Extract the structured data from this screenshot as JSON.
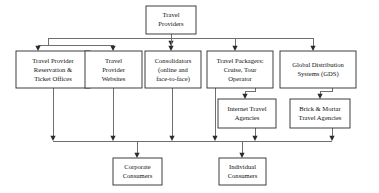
{
  "diagram": {
    "colors": {
      "background": "#ffffff",
      "box_border": "#2b2b2b",
      "connector": "#6f6f6f",
      "arrow": "#2b2b2b",
      "text": "#111111"
    },
    "nodes": [
      {
        "id": "travel-providers",
        "lines": [
          "Travel",
          "Providers"
        ],
        "x": 146,
        "y": 6,
        "w": 50,
        "h": 28
      },
      {
        "id": "provider-reservation-offices",
        "lines": [
          "Travel Provider",
          "Reservation &",
          "Ticket Offices"
        ],
        "x": 16,
        "y": 51,
        "w": 74,
        "h": 37
      },
      {
        "id": "provider-websites",
        "lines": [
          "Travel",
          "Provider",
          "Websites"
        ],
        "x": 85,
        "y": 51,
        "w": 57,
        "h": 37
      },
      {
        "id": "consolidators",
        "lines": [
          "Consolidators",
          "(online and",
          "face-to-face)"
        ],
        "x": 145,
        "y": 51,
        "w": 56,
        "h": 37
      },
      {
        "id": "travel-packagers",
        "lines": [
          "Travel Packagers:",
          "Cruise, Tour",
          "Operator"
        ],
        "x": 207,
        "y": 51,
        "w": 66,
        "h": 37
      },
      {
        "id": "global-distribution-systems",
        "lines": [
          "Global Distribution",
          "Systems (GDS)"
        ],
        "x": 280,
        "y": 51,
        "w": 76,
        "h": 37
      },
      {
        "id": "internet-travel-agencies",
        "lines": [
          "Internet Travel",
          "Agencies"
        ],
        "x": 218,
        "y": 99,
        "w": 58,
        "h": 29
      },
      {
        "id": "brick-mortar-travel-agencies",
        "lines": [
          "Brick & Mortar",
          "Travel Agencies"
        ],
        "x": 290,
        "y": 99,
        "w": 60,
        "h": 29
      },
      {
        "id": "corporate-consumers",
        "lines": [
          "Corporate",
          "Consumers"
        ],
        "x": 113,
        "y": 158,
        "w": 49,
        "h": 27
      },
      {
        "id": "individual-consumers",
        "lines": [
          "Individual",
          "Consumers"
        ],
        "x": 219,
        "y": 158,
        "w": 47,
        "h": 27
      }
    ],
    "edges": [
      {
        "id": "providers-to-bus",
        "from": "travel-providers",
        "to": "top-bus"
      },
      {
        "id": "bus-to-reservation-offices",
        "from": "top-bus",
        "to": "provider-reservation-offices"
      },
      {
        "id": "bus-to-provider-websites",
        "from": "top-bus",
        "to": "provider-websites"
      },
      {
        "id": "bus-to-consolidators",
        "from": "top-bus",
        "to": "consolidators"
      },
      {
        "id": "bus-to-travel-packagers",
        "from": "top-bus",
        "to": "travel-packagers"
      },
      {
        "id": "bus-to-gds",
        "from": "top-bus",
        "to": "global-distribution-systems"
      },
      {
        "id": "packagers-to-internet-agencies",
        "from": "travel-packagers",
        "to": "internet-travel-agencies"
      },
      {
        "id": "gds-to-brick-mortar",
        "from": "global-distribution-systems",
        "to": "brick-mortar-travel-agencies"
      },
      {
        "id": "reservation-offices-to-consumer-bus",
        "from": "provider-reservation-offices",
        "to": "consumer-bus"
      },
      {
        "id": "provider-websites-to-consumer-bus",
        "from": "provider-websites",
        "to": "consumer-bus"
      },
      {
        "id": "consolidators-to-consumer-bus",
        "from": "consolidators",
        "to": "consumer-bus"
      },
      {
        "id": "packagers-to-consumer-bus",
        "from": "travel-packagers",
        "to": "consumer-bus"
      },
      {
        "id": "internet-agencies-to-consumer-bus",
        "from": "internet-travel-agencies",
        "to": "consumer-bus"
      },
      {
        "id": "brick-mortar-to-consumer-bus",
        "from": "brick-mortar-travel-agencies",
        "to": "consumer-bus"
      },
      {
        "id": "consumer-bus-to-corporate",
        "from": "consumer-bus",
        "to": "corporate-consumers"
      },
      {
        "id": "consumer-bus-to-individual",
        "from": "consumer-bus",
        "to": "individual-consumers"
      }
    ]
  }
}
